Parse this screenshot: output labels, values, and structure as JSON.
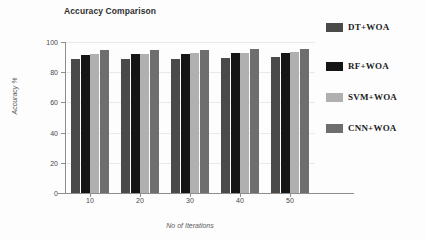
{
  "chart_data": {
    "type": "bar",
    "title": "Accuracy Comparison",
    "xlabel": "No of Iterations",
    "ylabel": "Accuracy %",
    "categories": [
      "10",
      "20",
      "30",
      "40",
      "50"
    ],
    "ylim": [
      0,
      100
    ],
    "yticks": [
      "0",
      "20",
      "40",
      "60",
      "80",
      "100"
    ],
    "grid": true,
    "legend_position": "right",
    "series": [
      {
        "name": "DT+WOA",
        "color": "#4a4a4a",
        "values": [
          89.0,
          88.5,
          88.8,
          89.3,
          90.0
        ]
      },
      {
        "name": "RF+WOA",
        "color": "#151515",
        "values": [
          91.5,
          92.0,
          92.2,
          92.6,
          93.0
        ]
      },
      {
        "name": "SVM+WOA",
        "color": "#b0b0b0",
        "values": [
          91.8,
          92.0,
          92.6,
          92.9,
          93.6
        ]
      },
      {
        "name": "CNN+WOA",
        "color": "#6e6e6e",
        "values": [
          94.6,
          94.4,
          94.8,
          95.1,
          95.4
        ]
      }
    ]
  }
}
